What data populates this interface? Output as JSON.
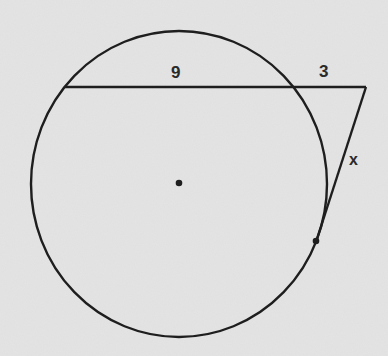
{
  "diagram": {
    "type": "geometry-secant-tangent",
    "colors": {
      "background": "#e4e4e4",
      "stroke": "#1e1e1e",
      "text": "#2a2a2a"
    },
    "circle": {
      "cx": 179,
      "cy": 184,
      "rx": 148,
      "ry": 153,
      "center_point": {
        "x": 179,
        "y": 183
      }
    },
    "secant": {
      "start": {
        "x": 65,
        "y": 87
      },
      "intersection": {
        "x": 290,
        "y": 87
      },
      "external_point": {
        "x": 366,
        "y": 87
      }
    },
    "tangent": {
      "from": {
        "x": 366,
        "y": 87
      },
      "tangent_point": {
        "x": 316,
        "y": 242
      }
    },
    "labels": {
      "internal_segment": "9",
      "external_segment": "3",
      "tangent_segment": "x"
    }
  }
}
